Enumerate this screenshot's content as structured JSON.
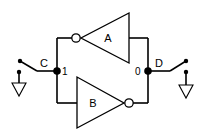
{
  "diagram": {
    "gates": [
      {
        "id": "A",
        "label": "A",
        "type": "inverter",
        "direction": "right-to-left"
      },
      {
        "id": "B",
        "label": "B",
        "type": "inverter",
        "direction": "left-to-right"
      }
    ],
    "nodes": [
      {
        "id": "C",
        "label": "C",
        "value": "1"
      },
      {
        "id": "D",
        "label": "D",
        "value": "0"
      }
    ],
    "switches": [
      {
        "id": "switch-c",
        "side": "left",
        "ground_symbol": "ground-icon"
      },
      {
        "id": "switch-d",
        "side": "right",
        "ground_symbol": "ground-icon"
      }
    ]
  }
}
